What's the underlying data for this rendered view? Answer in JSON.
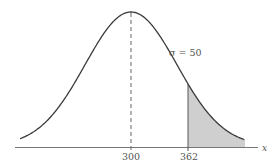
{
  "chart_data": {
    "type": "area",
    "title": "",
    "distribution": "normal",
    "mean": 300,
    "sigma": 50,
    "sigma_label": "σ = 50",
    "xlabel": "x",
    "ylabel": "",
    "x_ticks": [
      300,
      362
    ],
    "x_tick_labels": [
      "300",
      "362"
    ],
    "shaded_region": {
      "from": 362,
      "to": "right tail",
      "meaning": "P(X > 362)"
    },
    "mean_marker": {
      "x": 300,
      "style": "dashed vertical line"
    },
    "grid": false,
    "legend": null
  },
  "colors": {
    "curve": "#3a3a3a",
    "axis": "#666666",
    "shade": "#cfcfcf",
    "text": "#555555"
  }
}
